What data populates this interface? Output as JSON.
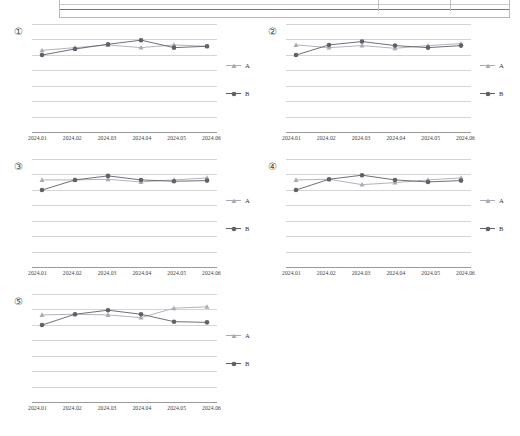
{
  "page": {
    "background": "#ffffff",
    "top_fragment": {
      "name": "clipped-table-fragment",
      "visible_rows": 1
    }
  },
  "legend": {
    "items": [
      {
        "label": "A",
        "color": "#a9a9b8",
        "marker": "triangle"
      },
      {
        "label": "B",
        "color": "#5f6068",
        "marker": "circle"
      }
    ]
  },
  "axis": {
    "categories": [
      "2024.01",
      "2024.02",
      "2024.03",
      "2024.04",
      "2024.05",
      "2024.06"
    ],
    "gridline_count": 8,
    "y_tick_labels": []
  },
  "chart_data": [
    {
      "type": "line",
      "panel_number": "①",
      "title": "",
      "xlabel": "",
      "ylabel": "",
      "categories": [
        "2024.01",
        "2024.02",
        "2024.03",
        "2024.04",
        "2024.05",
        "2024.06"
      ],
      "ylim": [
        0,
        8
      ],
      "grid": true,
      "legend_position": "right",
      "series": [
        {
          "name": "A",
          "color": "#a9a9b8",
          "marker": "triangle",
          "values": [
            6.05,
            6.25,
            6.45,
            6.25,
            6.45,
            6.35
          ]
        },
        {
          "name": "B",
          "color": "#5f6068",
          "marker": "circle",
          "values": [
            5.7,
            6.15,
            6.5,
            6.8,
            6.25,
            6.35
          ]
        }
      ]
    },
    {
      "type": "line",
      "panel_number": "②",
      "title": "",
      "xlabel": "",
      "ylabel": "",
      "categories": [
        "2024.01",
        "2024.02",
        "2024.03",
        "2024.04",
        "2024.05",
        "2024.06"
      ],
      "ylim": [
        0,
        8
      ],
      "grid": true,
      "legend_position": "right",
      "series": [
        {
          "name": "A",
          "color": "#a9a9b8",
          "marker": "triangle",
          "values": [
            6.45,
            6.25,
            6.4,
            6.2,
            6.4,
            6.55
          ]
        },
        {
          "name": "B",
          "color": "#5f6068",
          "marker": "circle",
          "values": [
            5.7,
            6.45,
            6.7,
            6.4,
            6.25,
            6.4
          ]
        }
      ]
    },
    {
      "type": "line",
      "panel_number": "③",
      "title": "",
      "xlabel": "",
      "ylabel": "",
      "categories": [
        "2024.01",
        "2024.02",
        "2024.03",
        "2024.04",
        "2024.05",
        "2024.06"
      ],
      "ylim": [
        0,
        8
      ],
      "grid": true,
      "legend_position": "right",
      "series": [
        {
          "name": "A",
          "color": "#a9a9b8",
          "marker": "triangle",
          "values": [
            6.45,
            6.45,
            6.5,
            6.3,
            6.45,
            6.6
          ]
        },
        {
          "name": "B",
          "color": "#5f6068",
          "marker": "circle",
          "values": [
            5.7,
            6.45,
            6.75,
            6.45,
            6.35,
            6.4
          ]
        }
      ]
    },
    {
      "type": "line",
      "panel_number": "④",
      "title": "",
      "xlabel": "",
      "ylabel": "",
      "categories": [
        "2024.01",
        "2024.02",
        "2024.03",
        "2024.04",
        "2024.05",
        "2024.06"
      ],
      "ylim": [
        0,
        8
      ],
      "grid": true,
      "legend_position": "right",
      "series": [
        {
          "name": "A",
          "color": "#a9a9b8",
          "marker": "triangle",
          "values": [
            6.45,
            6.5,
            6.1,
            6.25,
            6.45,
            6.6
          ]
        },
        {
          "name": "B",
          "color": "#5f6068",
          "marker": "circle",
          "values": [
            5.7,
            6.5,
            6.8,
            6.45,
            6.3,
            6.4
          ]
        }
      ]
    },
    {
      "type": "line",
      "panel_number": "⑤",
      "title": "",
      "xlabel": "",
      "ylabel": "",
      "categories": [
        "2024.01",
        "2024.02",
        "2024.03",
        "2024.04",
        "2024.05",
        "2024.06"
      ],
      "ylim": [
        0,
        8
      ],
      "grid": true,
      "legend_position": "right",
      "series": [
        {
          "name": "A",
          "color": "#a9a9b8",
          "marker": "triangle",
          "values": [
            6.45,
            6.5,
            6.45,
            6.25,
            6.95,
            7.05
          ]
        },
        {
          "name": "B",
          "color": "#5f6068",
          "marker": "circle",
          "values": [
            5.7,
            6.5,
            6.8,
            6.5,
            5.95,
            5.9
          ]
        }
      ]
    }
  ]
}
